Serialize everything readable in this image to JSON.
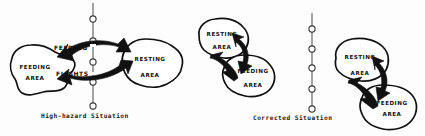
{
  "figure": {
    "width": 425,
    "height": 136,
    "ink_color": "#111111",
    "line_color": "#555555",
    "background": "#fdfdfd"
  },
  "panels": [
    {
      "id": "high-hazard",
      "caption": "High-hazard Situation",
      "caption_pos": {
        "x": 41,
        "y": 115
      },
      "powerline": {
        "name": "transmission-line",
        "x": 93,
        "y_top": 3,
        "y_bottom": 110,
        "insulator_count": 5,
        "insulator_y": [
          19,
          41,
          62,
          82,
          106
        ]
      },
      "areas": [
        {
          "label_line1": "FEEDING",
          "label_line2": "AREA",
          "cx": 34,
          "cy": 70,
          "name": "feeding-area-left"
        },
        {
          "label_line1": "RESTING",
          "label_line2": "AREA",
          "cx": 150,
          "cy": 62,
          "name": "resting-area-right"
        }
      ],
      "flight_label": {
        "line1": "FEEDING",
        "line2": "FLIGHTS",
        "x": 72,
        "y": 47
      },
      "arrows": "double-headed thick arrow crossing the power line"
    },
    {
      "id": "corrected-left",
      "caption": "Corrected Situation",
      "caption_pos": {
        "x": 253,
        "y": 117
      },
      "powerline": {
        "name": "transmission-line",
        "x": 312,
        "y_top": 13,
        "y_bottom": 112,
        "insulator_count": 5,
        "insulator_y": [
          29,
          49,
          68,
          89,
          109
        ]
      },
      "areas": [
        {
          "label_line1": "RESTING",
          "label_line2": "AREA",
          "cx": 221,
          "cy": 38,
          "name": "resting-area-upper"
        },
        {
          "label_line1": "FEEDING",
          "label_line2": "AREA",
          "cx": 253,
          "cy": 74,
          "name": "feeding-area-lower"
        }
      ],
      "arrows": "double-headed thick arrow between areas, clear of the line"
    },
    {
      "id": "corrected-right",
      "caption": "",
      "areas": [
        {
          "label_line1": "RESTING",
          "label_line2": "AREA",
          "cx": 358,
          "cy": 62,
          "name": "resting-area-upper"
        },
        {
          "label_line1": "FEEDING",
          "label_line2": "AREA",
          "cx": 392,
          "cy": 106,
          "name": "feeding-area-lower"
        }
      ],
      "arrows": "double-headed thick arrow between areas, clear of the line"
    }
  ],
  "labels": {
    "feeding": "FEEDING",
    "resting": "RESTING",
    "area": "AREA",
    "flights": "FLIGHTS",
    "high_hazard_caption": "High-hazard Situation",
    "corrected_caption": "Corrected Situation"
  }
}
